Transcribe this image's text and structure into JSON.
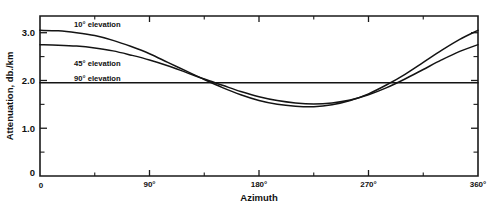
{
  "chart_data": {
    "type": "line",
    "title": "",
    "xlabel": "Azimuth",
    "ylabel": "Attenuation, db./km",
    "xlim": [
      0,
      360
    ],
    "ylim": [
      0,
      3.35
    ],
    "grid": false,
    "legend_position": "inline-annotations",
    "x_tick_labels": [
      "0",
      "90°",
      "180°",
      "270°",
      "360°"
    ],
    "x_tick_values": [
      0,
      90,
      180,
      270,
      360
    ],
    "x_minor_tick_values": [
      45,
      135,
      225,
      315
    ],
    "y_tick_labels": [
      "0",
      "1.0",
      "2.0",
      "3.0"
    ],
    "y_tick_values": [
      0,
      1.0,
      2.0,
      3.0
    ],
    "y_minor_tick_values": [
      0.5,
      1.5,
      2.5
    ],
    "x": [
      0,
      15,
      30,
      45,
      60,
      75,
      90,
      105,
      120,
      135,
      150,
      165,
      180,
      195,
      210,
      225,
      240,
      255,
      270,
      285,
      300,
      315,
      330,
      345,
      360
    ],
    "series": [
      {
        "name": "10° elevation",
        "label": "10° elevation",
        "label_x": 28,
        "label_y": 3.12,
        "values": [
          3.05,
          3.04,
          3.0,
          2.94,
          2.84,
          2.71,
          2.56,
          2.38,
          2.2,
          2.02,
          1.85,
          1.7,
          1.58,
          1.5,
          1.46,
          1.45,
          1.49,
          1.58,
          1.72,
          1.91,
          2.13,
          2.38,
          2.63,
          2.86,
          3.05
        ]
      },
      {
        "name": "45° elevation",
        "label": "45° elevation",
        "label_x": 28,
        "label_y": 2.3,
        "values": [
          2.75,
          2.74,
          2.72,
          2.68,
          2.62,
          2.53,
          2.43,
          2.31,
          2.17,
          2.03,
          1.9,
          1.77,
          1.66,
          1.58,
          1.53,
          1.51,
          1.53,
          1.59,
          1.7,
          1.85,
          2.03,
          2.23,
          2.43,
          2.61,
          2.75
        ]
      },
      {
        "name": "90° elevation",
        "label": "90° elevation",
        "label_x": 28,
        "label_y": 1.98,
        "values": [
          1.95,
          1.95,
          1.95,
          1.95,
          1.95,
          1.95,
          1.95,
          1.95,
          1.95,
          1.95,
          1.95,
          1.95,
          1.95,
          1.95,
          1.95,
          1.95,
          1.95,
          1.95,
          1.95,
          1.95,
          1.95,
          1.95,
          1.95,
          1.95,
          1.95
        ]
      }
    ]
  },
  "colors": {
    "line": "#141414",
    "axis": "#1a1a1a",
    "background": "#ffffff"
  }
}
